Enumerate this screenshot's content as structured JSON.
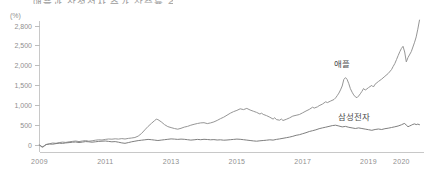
{
  "figure": {
    "cropped_title_partial": "애플과 삼성전자 주가 상승률 추이"
  },
  "chart_data": {
    "type": "line",
    "unit_label": "(%)",
    "grid": false,
    "legend_position": "inline-annotations",
    "colors": {
      "background": "#ffffff",
      "axis": "#c8c8c8",
      "tick": "#bdbdbd",
      "tick_label": "#8f8f8f",
      "series_label": "#4d4d4d",
      "apple_line": "#969696",
      "samsung_line": "#7f7f7f"
    },
    "y_axis": {
      "tick_values": [
        0,
        500,
        1000,
        1500,
        2000,
        2500,
        2800
      ],
      "tick_labels": [
        "0",
        "500",
        "1,000",
        "1,500",
        "2,000",
        "2,500",
        "2,800"
      ],
      "range_note_top_value": 2800
    },
    "x_axis": {
      "ticks": [
        {
          "label": "2009",
          "year": 2009
        },
        {
          "label": "2011",
          "year": 2011
        },
        {
          "label": "2013",
          "year": 2013
        },
        {
          "label": "2015",
          "year": 2015
        },
        {
          "label": "2017",
          "year": 2017
        },
        {
          "label": "2019",
          "year": 2019
        },
        {
          "label": "2020",
          "year": 2020
        }
      ],
      "xlim": [
        2009,
        2020.62
      ]
    },
    "series": [
      {
        "name": "애플",
        "color_key": "apple_line",
        "label_anchor": {
          "year": 2018.2,
          "value": 2040
        },
        "points": [
          [
            2009.0,
            0
          ],
          [
            2009.05,
            -40
          ],
          [
            2009.1,
            -55
          ],
          [
            2009.15,
            -25
          ],
          [
            2009.2,
            10
          ],
          [
            2009.3,
            30
          ],
          [
            2009.4,
            50
          ],
          [
            2009.5,
            42
          ],
          [
            2009.6,
            60
          ],
          [
            2009.7,
            72
          ],
          [
            2009.8,
            66
          ],
          [
            2009.9,
            80
          ],
          [
            2010.0,
            92
          ],
          [
            2010.1,
            102
          ],
          [
            2010.2,
            86
          ],
          [
            2010.3,
            100
          ],
          [
            2010.4,
            112
          ],
          [
            2010.5,
            96
          ],
          [
            2010.6,
            106
          ],
          [
            2010.7,
            122
          ],
          [
            2010.8,
            132
          ],
          [
            2010.9,
            126
          ],
          [
            2011.0,
            140
          ],
          [
            2011.1,
            152
          ],
          [
            2011.2,
            146
          ],
          [
            2011.3,
            156
          ],
          [
            2011.4,
            150
          ],
          [
            2011.5,
            162
          ],
          [
            2011.6,
            152
          ],
          [
            2011.7,
            166
          ],
          [
            2011.8,
            176
          ],
          [
            2011.9,
            188
          ],
          [
            2012.0,
            225
          ],
          [
            2012.1,
            290
          ],
          [
            2012.2,
            380
          ],
          [
            2012.3,
            470
          ],
          [
            2012.4,
            545
          ],
          [
            2012.5,
            615
          ],
          [
            2012.55,
            650
          ],
          [
            2012.6,
            640
          ],
          [
            2012.7,
            585
          ],
          [
            2012.8,
            515
          ],
          [
            2012.9,
            465
          ],
          [
            2013.0,
            438
          ],
          [
            2013.1,
            415
          ],
          [
            2013.2,
            398
          ],
          [
            2013.3,
            420
          ],
          [
            2013.4,
            452
          ],
          [
            2013.5,
            470
          ],
          [
            2013.6,
            500
          ],
          [
            2013.7,
            522
          ],
          [
            2013.8,
            542
          ],
          [
            2013.9,
            556
          ],
          [
            2014.0,
            562
          ],
          [
            2014.1,
            540
          ],
          [
            2014.2,
            556
          ],
          [
            2014.3,
            582
          ],
          [
            2014.4,
            620
          ],
          [
            2014.5,
            662
          ],
          [
            2014.6,
            702
          ],
          [
            2014.7,
            752
          ],
          [
            2014.8,
            802
          ],
          [
            2014.9,
            842
          ],
          [
            2015.0,
            872
          ],
          [
            2015.1,
            912
          ],
          [
            2015.2,
            892
          ],
          [
            2015.3,
            922
          ],
          [
            2015.4,
            882
          ],
          [
            2015.5,
            852
          ],
          [
            2015.6,
            822
          ],
          [
            2015.7,
            782
          ],
          [
            2015.75,
            802
          ],
          [
            2015.8,
            772
          ],
          [
            2015.9,
            742
          ],
          [
            2016.0,
            702
          ],
          [
            2016.1,
            652
          ],
          [
            2016.15,
            688
          ],
          [
            2016.2,
            640
          ],
          [
            2016.3,
            625
          ],
          [
            2016.35,
            655
          ],
          [
            2016.4,
            618
          ],
          [
            2016.5,
            648
          ],
          [
            2016.6,
            682
          ],
          [
            2016.7,
            728
          ],
          [
            2016.8,
            748
          ],
          [
            2016.9,
            768
          ],
          [
            2017.0,
            812
          ],
          [
            2017.1,
            858
          ],
          [
            2017.2,
            898
          ],
          [
            2017.3,
            952
          ],
          [
            2017.35,
            930
          ],
          [
            2017.45,
            962
          ],
          [
            2017.5,
            992
          ],
          [
            2017.6,
            1032
          ],
          [
            2017.7,
            1088
          ],
          [
            2017.75,
            1068
          ],
          [
            2017.85,
            1108
          ],
          [
            2017.95,
            1148
          ],
          [
            2018.0,
            1188
          ],
          [
            2018.05,
            1242
          ],
          [
            2018.1,
            1308
          ],
          [
            2018.15,
            1388
          ],
          [
            2018.2,
            1488
          ],
          [
            2018.25,
            1652
          ],
          [
            2018.3,
            1700
          ],
          [
            2018.35,
            1655
          ],
          [
            2018.4,
            1545
          ],
          [
            2018.45,
            1420
          ],
          [
            2018.5,
            1330
          ],
          [
            2018.55,
            1262
          ],
          [
            2018.6,
            1215
          ],
          [
            2018.65,
            1192
          ],
          [
            2018.7,
            1235
          ],
          [
            2018.75,
            1292
          ],
          [
            2018.8,
            1352
          ],
          [
            2018.85,
            1425
          ],
          [
            2018.9,
            1385
          ],
          [
            2018.95,
            1415
          ],
          [
            2019.0,
            1448
          ],
          [
            2019.1,
            1502
          ],
          [
            2019.15,
            1462
          ],
          [
            2019.2,
            1532
          ],
          [
            2019.3,
            1602
          ],
          [
            2019.4,
            1662
          ],
          [
            2019.5,
            1732
          ],
          [
            2019.6,
            1802
          ],
          [
            2019.7,
            1902
          ],
          [
            2019.75,
            1982
          ],
          [
            2019.8,
            2052
          ],
          [
            2019.85,
            2152
          ],
          [
            2019.9,
            2252
          ],
          [
            2019.95,
            2352
          ],
          [
            2020.0,
            2432
          ],
          [
            2020.05,
            2488
          ],
          [
            2020.1,
            2345
          ],
          [
            2020.15,
            2095
          ],
          [
            2020.2,
            2205
          ],
          [
            2020.3,
            2355
          ],
          [
            2020.4,
            2555
          ],
          [
            2020.45,
            2635
          ],
          [
            2020.5,
            2752
          ],
          [
            2020.55,
            2890
          ]
        ]
      },
      {
        "name": "삼성전자",
        "color_key": "samsung_line",
        "label_anchor": {
          "year": 2018.55,
          "value": 705
        },
        "points": [
          [
            2009.0,
            0
          ],
          [
            2009.05,
            -30
          ],
          [
            2009.1,
            -45
          ],
          [
            2009.15,
            -15
          ],
          [
            2009.2,
            12
          ],
          [
            2009.3,
            25
          ],
          [
            2009.4,
            20
          ],
          [
            2009.5,
            35
          ],
          [
            2009.6,
            46
          ],
          [
            2009.7,
            40
          ],
          [
            2009.8,
            54
          ],
          [
            2009.9,
            60
          ],
          [
            2010.0,
            70
          ],
          [
            2010.1,
            76
          ],
          [
            2010.2,
            64
          ],
          [
            2010.3,
            74
          ],
          [
            2010.4,
            86
          ],
          [
            2010.5,
            80
          ],
          [
            2010.6,
            70
          ],
          [
            2010.7,
            80
          ],
          [
            2010.8,
            90
          ],
          [
            2010.9,
            96
          ],
          [
            2011.0,
            100
          ],
          [
            2011.1,
            90
          ],
          [
            2011.2,
            80
          ],
          [
            2011.3,
            86
          ],
          [
            2011.4,
            70
          ],
          [
            2011.5,
            54
          ],
          [
            2011.6,
            44
          ],
          [
            2011.7,
            60
          ],
          [
            2011.8,
            80
          ],
          [
            2011.9,
            96
          ],
          [
            2012.0,
            110
          ],
          [
            2012.1,
            120
          ],
          [
            2012.2,
            130
          ],
          [
            2012.3,
            140
          ],
          [
            2012.4,
            134
          ],
          [
            2012.5,
            124
          ],
          [
            2012.6,
            114
          ],
          [
            2012.7,
            124
          ],
          [
            2012.8,
            134
          ],
          [
            2012.9,
            144
          ],
          [
            2013.0,
            154
          ],
          [
            2013.1,
            148
          ],
          [
            2013.2,
            140
          ],
          [
            2013.3,
            150
          ],
          [
            2013.4,
            144
          ],
          [
            2013.5,
            134
          ],
          [
            2013.6,
            124
          ],
          [
            2013.7,
            130
          ],
          [
            2013.8,
            140
          ],
          [
            2013.9,
            134
          ],
          [
            2014.0,
            144
          ],
          [
            2014.1,
            138
          ],
          [
            2014.2,
            130
          ],
          [
            2014.3,
            136
          ],
          [
            2014.4,
            126
          ],
          [
            2014.5,
            130
          ],
          [
            2014.6,
            120
          ],
          [
            2014.7,
            126
          ],
          [
            2014.8,
            134
          ],
          [
            2014.9,
            140
          ],
          [
            2015.0,
            150
          ],
          [
            2015.1,
            144
          ],
          [
            2015.2,
            134
          ],
          [
            2015.3,
            124
          ],
          [
            2015.4,
            114
          ],
          [
            2015.5,
            104
          ],
          [
            2015.6,
            96
          ],
          [
            2015.7,
            106
          ],
          [
            2015.8,
            114
          ],
          [
            2015.9,
            120
          ],
          [
            2016.0,
            130
          ],
          [
            2016.1,
            124
          ],
          [
            2016.2,
            140
          ],
          [
            2016.3,
            154
          ],
          [
            2016.4,
            170
          ],
          [
            2016.5,
            184
          ],
          [
            2016.6,
            200
          ],
          [
            2016.7,
            220
          ],
          [
            2016.8,
            244
          ],
          [
            2016.9,
            260
          ],
          [
            2017.0,
            284
          ],
          [
            2017.1,
            310
          ],
          [
            2017.2,
            340
          ],
          [
            2017.3,
            360
          ],
          [
            2017.4,
            384
          ],
          [
            2017.5,
            410
          ],
          [
            2017.6,
            430
          ],
          [
            2017.7,
            450
          ],
          [
            2017.8,
            470
          ],
          [
            2017.9,
            490
          ],
          [
            2018.0,
            500
          ],
          [
            2018.1,
            480
          ],
          [
            2018.2,
            456
          ],
          [
            2018.3,
            470
          ],
          [
            2018.4,
            446
          ],
          [
            2018.5,
            430
          ],
          [
            2018.6,
            416
          ],
          [
            2018.7,
            430
          ],
          [
            2018.8,
            416
          ],
          [
            2018.9,
            400
          ],
          [
            2019.0,
            386
          ],
          [
            2019.1,
            370
          ],
          [
            2019.2,
            390
          ],
          [
            2019.3,
            404
          ],
          [
            2019.4,
            390
          ],
          [
            2019.5,
            410
          ],
          [
            2019.6,
            424
          ],
          [
            2019.7,
            440
          ],
          [
            2019.8,
            460
          ],
          [
            2019.9,
            480
          ],
          [
            2020.0,
            510
          ],
          [
            2020.05,
            530
          ],
          [
            2020.1,
            545
          ],
          [
            2020.15,
            498
          ],
          [
            2020.2,
            462
          ],
          [
            2020.25,
            480
          ],
          [
            2020.3,
            500
          ],
          [
            2020.35,
            520
          ],
          [
            2020.4,
            532
          ],
          [
            2020.45,
            514
          ],
          [
            2020.5,
            526
          ],
          [
            2020.55,
            512
          ]
        ]
      }
    ]
  }
}
